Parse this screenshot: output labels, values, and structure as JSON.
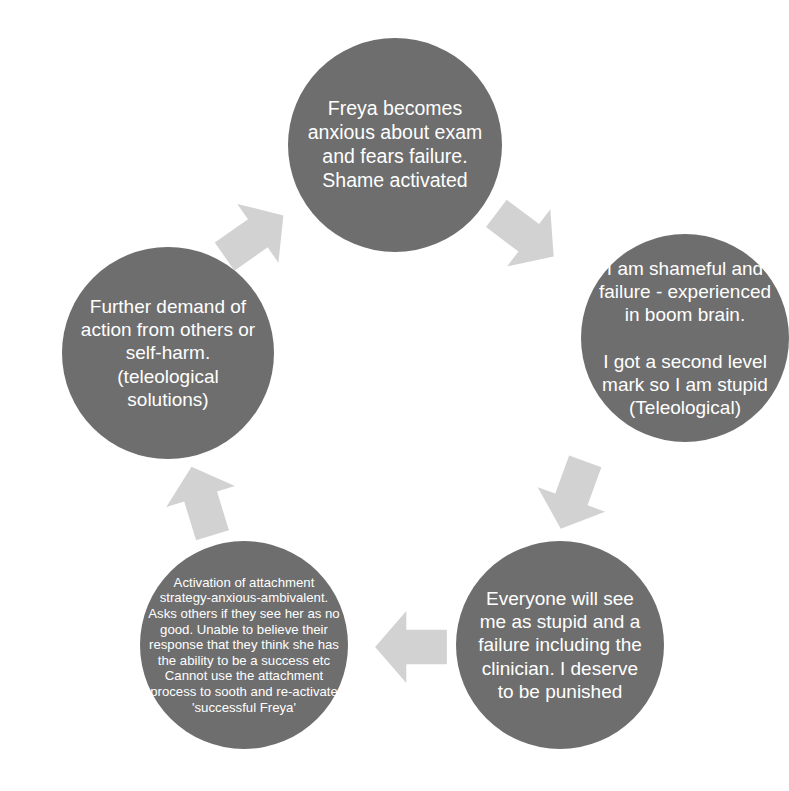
{
  "diagram": {
    "type": "cycle-diagram",
    "title": "",
    "colors": {
      "node_fill": "#6e6e6e",
      "node_text": "#ffffff",
      "arrow_fill": "#d2d2d2",
      "background": "#ffffff"
    },
    "nodes": [
      {
        "id": "node-top",
        "position": "top",
        "text": "Freya becomes anxious about exam and fears failure. Shame activated"
      },
      {
        "id": "node-right",
        "position": "right",
        "text": "I am shameful and failure - experienced in boom brain.\n\nI got a second level mark so I am stupid (Teleological)"
      },
      {
        "id": "node-bottom-right",
        "position": "bottom-right",
        "text": "Everyone will see me as stupid and a failure including the clinician. I deserve to be punished"
      },
      {
        "id": "node-bottom-left",
        "position": "bottom-left",
        "text": "Activation of attachment strategy-anxious-ambivalent. Asks others if they see her as no good. Unable to believe their response that they think she has the ability to be a success etc\nCannot use the attachment process to sooth and re-activate 'successful Freya'"
      },
      {
        "id": "node-left",
        "position": "left",
        "text": "Further demand of action from others or self-harm.\n(teleological solutions)"
      }
    ],
    "arrows": [
      {
        "id": "arrow-top-left",
        "from": "node-left",
        "to": "node-top",
        "direction": "up-right"
      },
      {
        "id": "arrow-top-right",
        "from": "node-top",
        "to": "node-right",
        "direction": "down-right"
      },
      {
        "id": "arrow-right",
        "from": "node-right",
        "to": "node-bottom-right",
        "direction": "down-left"
      },
      {
        "id": "arrow-bottom",
        "from": "node-bottom-right",
        "to": "node-bottom-left",
        "direction": "left"
      },
      {
        "id": "arrow-left",
        "from": "node-bottom-left",
        "to": "node-left",
        "direction": "up-left"
      }
    ]
  }
}
